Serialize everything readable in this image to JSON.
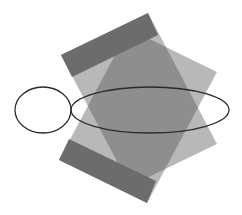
{
  "diagram": {
    "width": 242,
    "height": 215,
    "background": "#ffffff",
    "colors": {
      "light_fill": "#b8b8b8",
      "overlap_fill": "#8e8e8e",
      "cap_fill": "#6c6c6c",
      "ellipse_stroke": "#2a2a2a"
    },
    "shapes": {
      "rect_a": {
        "points": "61,55 148,13 217,144 130,186",
        "cap": "61,55 148,13 158,35 72,77"
      },
      "rect_b": {
        "points": "59,160 147,203 217,72 129,29",
        "cap": "59,160 147,203 156,181 69,139"
      },
      "overlap": "88,106 129,29 151,40 217,108 170,168 130,186",
      "ellipse_small": {
        "cx": 43,
        "cy": 110,
        "rx": 28,
        "ry": 23
      },
      "ellipse_large": {
        "cx": 150,
        "cy": 110,
        "rx": 79,
        "ry": 23
      }
    }
  }
}
